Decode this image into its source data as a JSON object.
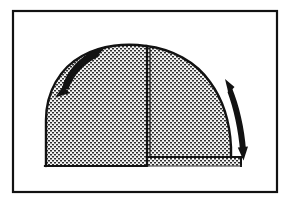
{
  "figure": {
    "title": "Stippled dome diagram with bidirectional curved arrows",
    "background_color": "#ffffff",
    "ink_color": "#121212",
    "stipple_color": "#3a3a3a",
    "stipple_fill_tone": "#d8d8d8",
    "frame": {
      "label": "figure-border",
      "x": 13,
      "y": 11,
      "width": 264,
      "height": 181,
      "stroke_width": 2.2
    },
    "dome": {
      "label": "half-dome-shape",
      "apex_x": 146,
      "apex_y": 46,
      "left_base_x": 46,
      "right_base_x": 242,
      "left_baseline_y": 166,
      "right_baseline_y": 157,
      "fill": "stipple",
      "outline_stroke_width": 2.4
    },
    "center_line": {
      "label": "vertical-centerline",
      "x": 147,
      "top_y": 46,
      "bottom_y": 158,
      "stroke_width": 2.2
    },
    "lower_right_band": {
      "label": "lower-right-shaded-band",
      "x": 147,
      "y": 157,
      "width": 95,
      "height": 9
    },
    "arrows": [
      {
        "name": "left-curved-double-arrow",
        "side": "left",
        "heads": 2,
        "head_upper_direction": "upper-right",
        "head_lower_direction": "lower-left",
        "start_x": 58,
        "start_y": 92,
        "end_x": 104,
        "end_y": 51
      },
      {
        "name": "right-curved-double-arrow",
        "side": "right",
        "heads": 2,
        "head_upper_direction": "upper-left",
        "head_lower_direction": "down",
        "start_x": 249,
        "start_y": 155,
        "end_x": 228,
        "end_y": 83
      }
    ]
  }
}
